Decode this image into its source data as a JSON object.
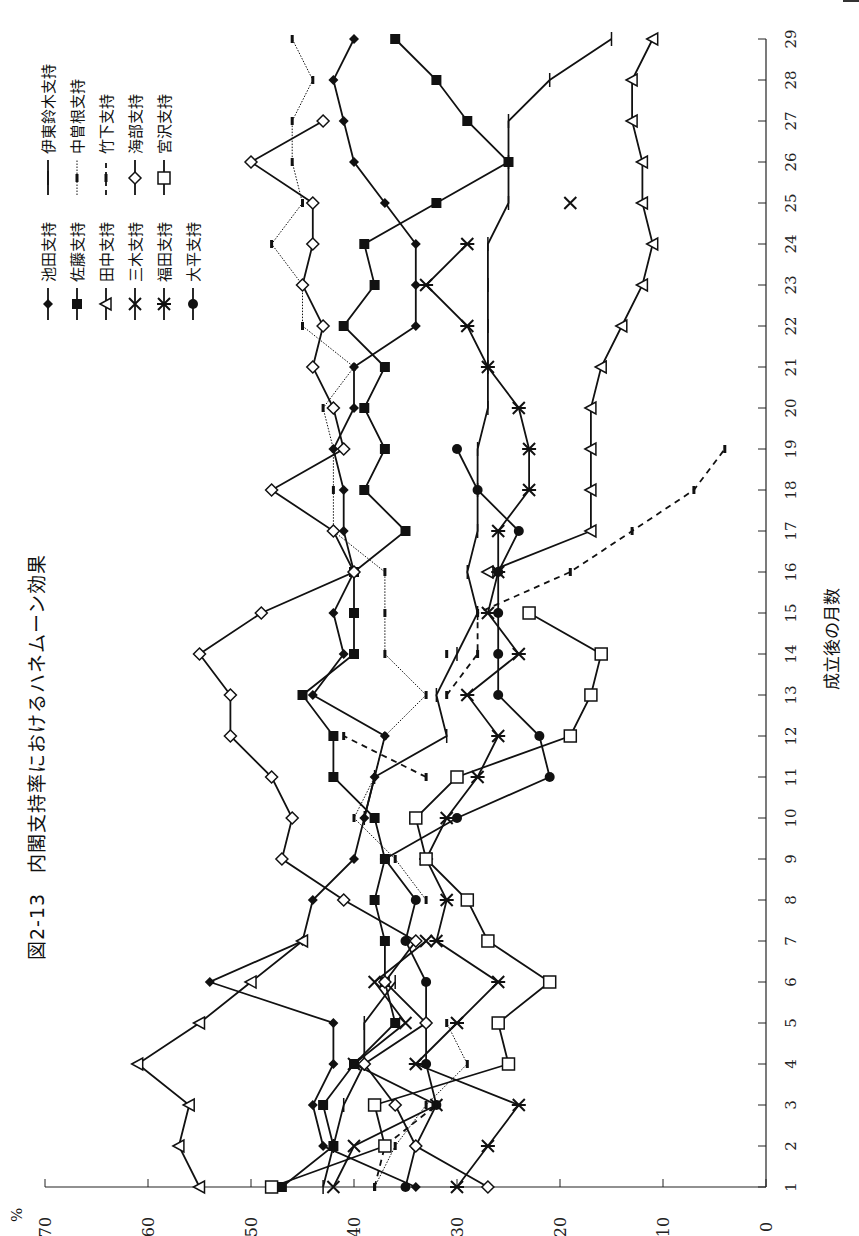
{
  "chart_data": {
    "type": "line",
    "title": "図2-13　内閣支持率におけるハネムーン効果",
    "xlabel": "成立後の月数",
    "ylabel": "%",
    "ylim": [
      0,
      70
    ],
    "yticks": [
      0,
      10,
      20,
      30,
      40,
      50,
      60,
      70
    ],
    "x": [
      1,
      2,
      3,
      4,
      5,
      6,
      7,
      8,
      9,
      10,
      11,
      12,
      13,
      14,
      15,
      16,
      17,
      18,
      19,
      20,
      21,
      22,
      23,
      24,
      25,
      26,
      27,
      28,
      29
    ],
    "orientation": "rotated 90° counter-clockwise (x-axis months on right edge, y-axis % along bottom)",
    "legend_position": "top-left (rotated)",
    "grid": false,
    "series": [
      {
        "name": "池田支持",
        "marker": "filled-diamond",
        "line": "solid",
        "values": [
          34,
          43,
          44,
          42,
          42,
          54,
          45,
          44,
          40,
          39,
          38,
          37,
          44,
          41,
          42,
          40,
          41,
          41,
          42,
          40,
          40,
          34,
          34,
          34,
          37,
          40,
          41,
          42,
          40
        ]
      },
      {
        "name": "佐藤支持",
        "marker": "filled-square",
        "line": "solid",
        "values": [
          47,
          42,
          43,
          40,
          36,
          37,
          37,
          38,
          37,
          38,
          42,
          42,
          45,
          40,
          40,
          40,
          35,
          39,
          37,
          39,
          37,
          41,
          38,
          39,
          32,
          25,
          29,
          32,
          36
        ]
      },
      {
        "name": "田中支持",
        "marker": "open-triangle",
        "line": "solid",
        "values": [
          55,
          57,
          56,
          61,
          55,
          50,
          45,
          null,
          null,
          null,
          null,
          null,
          null,
          null,
          null,
          27,
          17,
          17,
          17,
          17,
          16,
          14,
          12,
          11,
          12,
          12,
          13,
          13,
          11
        ]
      },
      {
        "name": "三木支持",
        "marker": "x",
        "line": "solid",
        "values": [
          42,
          40,
          32,
          40,
          35,
          38,
          33,
          null,
          null,
          null,
          null,
          null,
          null,
          null,
          null,
          null,
          null,
          null,
          null,
          null,
          null,
          null,
          null,
          null,
          19,
          null,
          null,
          null,
          null
        ]
      },
      {
        "name": "福田支持",
        "marker": "asterisk",
        "line": "solid",
        "values": [
          30,
          27,
          24,
          34,
          30,
          26,
          32,
          31,
          33,
          31,
          28,
          26,
          29,
          24,
          27,
          26,
          26,
          23,
          23,
          24,
          27,
          29,
          33,
          29,
          null,
          null,
          null,
          null,
          null
        ]
      },
      {
        "name": "大平支持",
        "marker": "filled-circle",
        "line": "solid",
        "values": [
          35,
          34,
          32,
          33,
          33,
          33,
          35,
          34,
          37,
          30,
          21,
          22,
          26,
          26,
          26,
          26,
          24,
          28,
          30,
          null,
          null,
          null,
          null,
          null,
          null,
          null,
          null,
          null,
          null
        ]
      },
      {
        "name": "伊東鈴木支持",
        "marker": "plus",
        "line": "solid",
        "values": [
          43,
          42,
          41,
          39,
          39,
          36,
          null,
          null,
          null,
          39,
          38,
          31,
          32,
          30,
          28,
          29,
          28,
          28,
          28,
          27,
          27,
          27,
          27,
          27,
          25,
          25,
          25,
          21,
          15
        ]
      },
      {
        "name": "中曽根支持",
        "marker": "small-bar",
        "line": "dotted",
        "values": [
          38,
          36,
          33,
          29,
          31,
          null,
          null,
          33,
          36,
          40,
          38,
          37,
          33,
          37,
          37,
          37,
          42,
          42,
          42,
          43,
          40,
          45,
          45,
          48,
          45,
          46,
          46,
          44,
          46
        ]
      },
      {
        "name": "竹下支持",
        "marker": "small-bar",
        "line": "dashed",
        "values": [
          38,
          37,
          32,
          null,
          null,
          null,
          null,
          null,
          null,
          null,
          33,
          41,
          null,
          31,
          null,
          null,
          null,
          null,
          null,
          null,
          null,
          null,
          null,
          null,
          null,
          null,
          null,
          null,
          null
        ],
        "tail": {
          "13": 31,
          "14": 28,
          "15": 28,
          "16": 19,
          "17": 13,
          "18": 7,
          "19": 4
        }
      },
      {
        "name": "海部支持",
        "marker": "open-diamond",
        "line": "solid",
        "values": [
          27,
          34,
          36,
          39,
          33,
          37,
          34,
          41,
          47,
          46,
          48,
          52,
          52,
          55,
          49,
          40,
          42,
          48,
          41,
          42,
          44,
          43,
          45,
          44,
          44,
          50,
          43,
          null,
          null
        ]
      },
      {
        "name": "宮沢支持",
        "marker": "open-square",
        "line": "solid",
        "values": [
          48,
          37,
          38,
          25,
          26,
          21,
          27,
          29,
          33,
          34,
          30,
          19,
          17,
          16,
          23,
          null,
          null,
          null,
          null,
          null,
          null,
          null,
          null,
          null,
          null,
          null,
          null,
          null,
          null
        ]
      }
    ]
  },
  "legend": {
    "col1": [
      "池田支持",
      "佐藤支持",
      "田中支持",
      "三木支持",
      "福田支持",
      "大平支持"
    ],
    "col2": [
      "伊東鈴木支持",
      "中曽根支持",
      "竹下支持",
      "海部支持",
      "宮沢支持"
    ]
  },
  "axis": {
    "percent_label": "%",
    "y_tick_labels": [
      "70",
      "60",
      "50",
      "40",
      "30",
      "20",
      "10",
      "0"
    ],
    "x_tick_labels": [
      "1",
      "2",
      "3",
      "4",
      "5",
      "6",
      "7",
      "8",
      "9",
      "10",
      "11",
      "12",
      "13",
      "14",
      "15",
      "16",
      "17",
      "18",
      "19",
      "20",
      "21",
      "22",
      "23",
      "24",
      "25",
      "26",
      "27",
      "28",
      "29"
    ]
  },
  "title": "図2-13　内閣支持率におけるハネムーン効果",
  "xlabel": "成立後の月数"
}
